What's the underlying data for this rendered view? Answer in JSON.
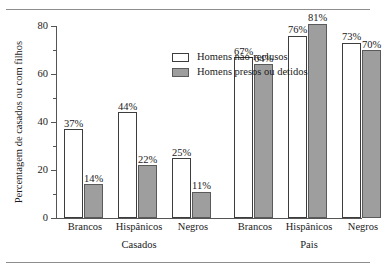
{
  "chart_data": {
    "type": "bar",
    "title": "",
    "xlabel": "",
    "ylabel": "Percentagem de casados ou com filhos",
    "ylim": [
      0,
      80
    ],
    "yticks": [
      0,
      20,
      40,
      60,
      80
    ],
    "ytick_labels": [
      "0",
      "20",
      "40",
      "60",
      "80"
    ],
    "grid": false,
    "legend_position": "top-left-inside",
    "categories": [
      "Brancos",
      "Hispânicos",
      "Negros",
      "Brancos",
      "Hispânicos",
      "Negros"
    ],
    "supergroups": [
      {
        "label": "Casados",
        "categories": [
          "Brancos",
          "Hispânicos",
          "Negros"
        ]
      },
      {
        "label": "Pais",
        "categories": [
          "Brancos",
          "Hispânicos",
          "Negros"
        ]
      }
    ],
    "series": [
      {
        "name": "Homens não-reclusos",
        "color": "#ffffff",
        "values": [
          37,
          44,
          25,
          67,
          76,
          73
        ],
        "data_labels": [
          "37%",
          "44%",
          "25%",
          "67%",
          "76%",
          "73%"
        ]
      },
      {
        "name": "Homens presos ou detidos",
        "color": "#9e9e9e",
        "values": [
          14,
          22,
          11,
          64,
          81,
          70
        ],
        "data_labels": [
          "14%",
          "22%",
          "11%",
          "64%",
          "81%",
          "70%"
        ]
      }
    ]
  },
  "legend": {
    "items": [
      {
        "label": "Homens não-reclusos",
        "swatch": "light"
      },
      {
        "label": "Homens presos ou detidos",
        "swatch": "dark"
      }
    ]
  }
}
